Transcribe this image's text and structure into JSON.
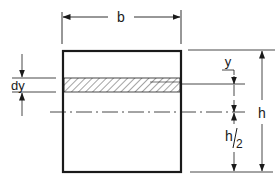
{
  "diagram": {
    "labels": {
      "width": "b",
      "height": "h",
      "half_height_num": "h",
      "half_height_den": "2",
      "strip_distance": "y",
      "strip_thickness": "dy"
    },
    "colors": {
      "line": "#1a1a1a",
      "background": "#ffffff"
    }
  }
}
